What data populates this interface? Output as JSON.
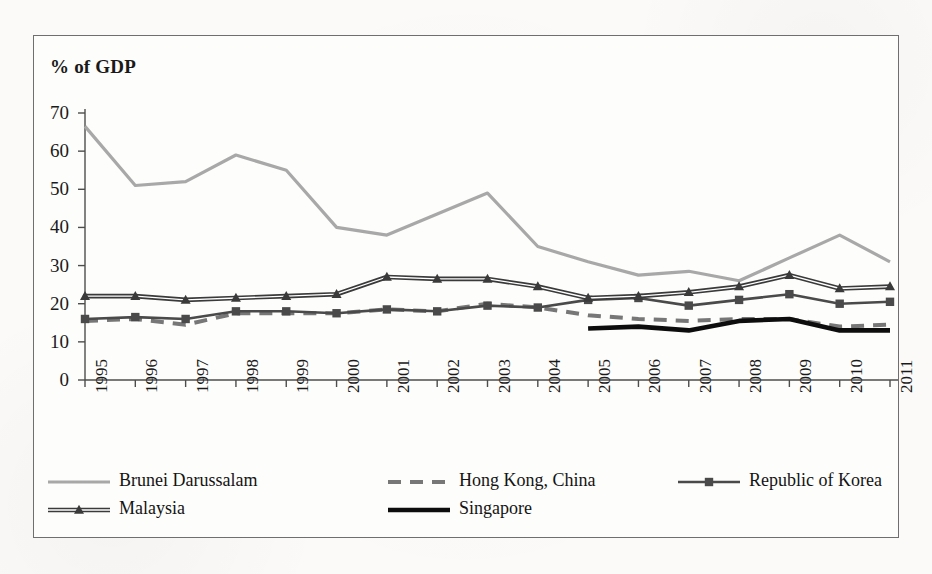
{
  "figure": {
    "axis_title": "% of GDP",
    "frame_color": "#6f6f6f",
    "background": "#fdfdfb"
  },
  "chart_data": {
    "type": "line",
    "title": "",
    "xlabel": "",
    "ylabel": "% of GDP",
    "ylim": [
      0,
      70
    ],
    "ytick_step": 10,
    "grid": false,
    "legend_position": "bottom",
    "categories": [
      "1995",
      "1996",
      "1997",
      "1998",
      "1999",
      "2000",
      "2001",
      "2002",
      "2003",
      "2004",
      "2005",
      "2006",
      "2007",
      "2008",
      "2009",
      "2010",
      "2011"
    ],
    "yticks": [
      "0",
      "10",
      "20",
      "30",
      "40",
      "50",
      "60",
      "70"
    ],
    "series": [
      {
        "name": "Brunei Darussalam",
        "color": "#a8a8a8",
        "style": "solid",
        "marker": "none",
        "width": 3.2,
        "values": [
          66.5,
          51.0,
          52.0,
          59.0,
          55.0,
          40.0,
          38.0,
          43.5,
          49.0,
          35.0,
          31.0,
          27.5,
          28.5,
          26.0,
          32.0,
          38.0,
          31.0
        ]
      },
      {
        "name": "Hong Kong, China",
        "color": "#777777",
        "style": "dashed",
        "marker": "none",
        "width": 4.0,
        "values": [
          15.5,
          16.0,
          14.5,
          17.5,
          17.5,
          17.5,
          18.5,
          18.0,
          20.0,
          19.0,
          17.0,
          16.0,
          15.5,
          16.0,
          16.0,
          14.0,
          14.5
        ]
      },
      {
        "name": "Republic of Korea",
        "color": "#4a4a4a",
        "style": "solid",
        "marker": "square",
        "width": 2.6,
        "values": [
          16.0,
          16.5,
          16.0,
          18.0,
          18.0,
          17.5,
          18.5,
          18.0,
          19.5,
          19.0,
          21.0,
          21.5,
          19.5,
          21.0,
          22.5,
          20.0,
          20.5
        ]
      },
      {
        "name": "Malaysia",
        "color": "#3a3a3a",
        "style": "double",
        "marker": "triangle",
        "width": 2.4,
        "values": [
          22.0,
          22.0,
          21.0,
          21.5,
          22.0,
          22.5,
          27.0,
          26.5,
          26.5,
          24.5,
          21.5,
          22.0,
          23.0,
          24.5,
          27.5,
          24.0,
          24.5
        ]
      },
      {
        "name": "Singapore",
        "color": "#0d0d0d",
        "style": "solid",
        "marker": "none",
        "width": 4.6,
        "values": [
          null,
          null,
          null,
          null,
          null,
          null,
          null,
          null,
          null,
          null,
          13.5,
          14.0,
          13.0,
          15.5,
          16.0,
          13.0,
          13.0
        ]
      }
    ]
  },
  "legend": {
    "entries": [
      {
        "label": "Brunei Darussalam"
      },
      {
        "label": "Hong Kong, China"
      },
      {
        "label": "Republic of Korea"
      },
      {
        "label": "Malaysia"
      },
      {
        "label": "Singapore"
      }
    ]
  }
}
